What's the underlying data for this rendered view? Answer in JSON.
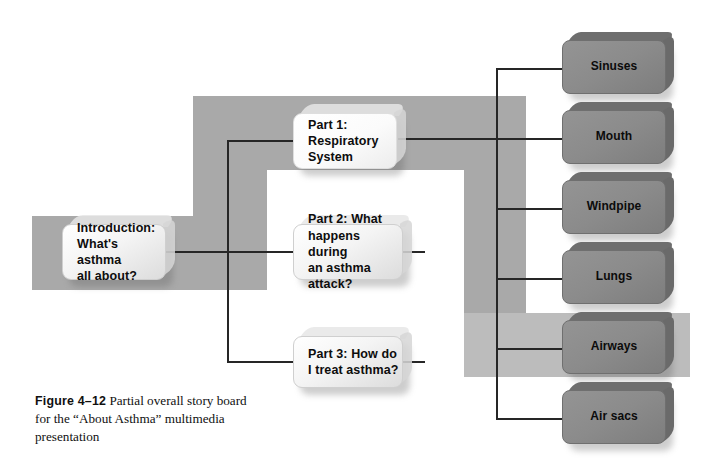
{
  "figure": {
    "number": "Figure 4–12",
    "caption": "Partial overall story board for the “About Asthma” multimedia presentation"
  },
  "diagram": {
    "type": "storyboard-flowchart",
    "colors": {
      "band_gray": "#a9a9a9",
      "band_light_gray": "#bcbcbc",
      "node_dark_fill": "#8b8b8b",
      "node_light_fill": "#f4f4f4",
      "connector": "#262626",
      "page_background": "#ffffff"
    },
    "root": {
      "id": "introduction",
      "label": "Introduction:\nWhat's asthma\nall about?"
    },
    "parts": [
      {
        "id": "part1",
        "label": "Part 1:\nRespiratory\nSystem"
      },
      {
        "id": "part2",
        "label": "Part 2: What\nhappens during\nan asthma attack?"
      },
      {
        "id": "part3",
        "label": "Part 3: How do\nI treat asthma?"
      }
    ],
    "topics": [
      {
        "id": "sinuses",
        "label": "Sinuses"
      },
      {
        "id": "mouth",
        "label": "Mouth"
      },
      {
        "id": "windpipe",
        "label": "Windpipe"
      },
      {
        "id": "lungs",
        "label": "Lungs"
      },
      {
        "id": "airways",
        "label": "Airways"
      },
      {
        "id": "air-sacs",
        "label": "Air sacs"
      }
    ],
    "edges": [
      {
        "from": "introduction",
        "to": "part1"
      },
      {
        "from": "introduction",
        "to": "part2"
      },
      {
        "from": "introduction",
        "to": "part3"
      },
      {
        "from": "part1",
        "to": "sinuses"
      },
      {
        "from": "part1",
        "to": "mouth"
      },
      {
        "from": "part1",
        "to": "windpipe"
      },
      {
        "from": "part1",
        "to": "lungs"
      },
      {
        "from": "part1",
        "to": "airways"
      },
      {
        "from": "part1",
        "to": "air-sacs"
      }
    ]
  }
}
